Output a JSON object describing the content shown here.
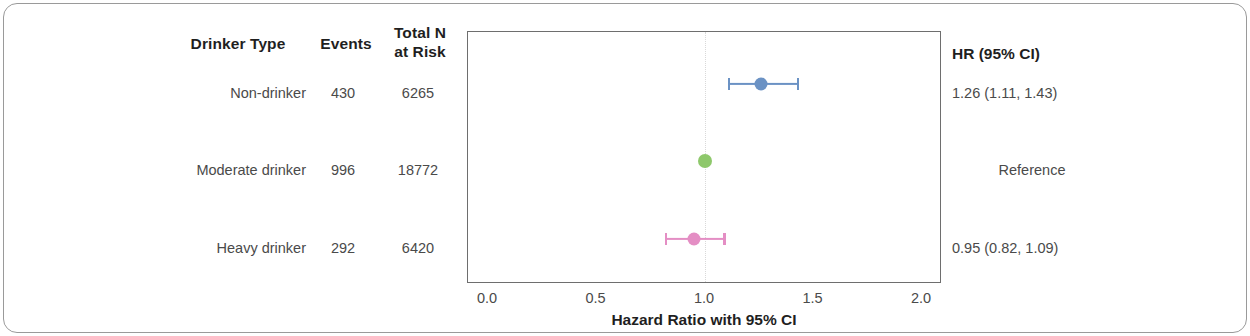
{
  "figure": {
    "width": 1250,
    "height": 336
  },
  "table": {
    "headers": {
      "drinker_type": "Drinker Type",
      "events": "Events",
      "total_n_line1": "Total N",
      "total_n_line2": "at Risk"
    },
    "rows": [
      {
        "label": "Non-drinker",
        "events": "430",
        "total_n": "6265"
      },
      {
        "label": "Moderate drinker",
        "events": "996",
        "total_n": "18772"
      },
      {
        "label": "Heavy drinker",
        "events": "292",
        "total_n": "6420"
      }
    ]
  },
  "hr_column": {
    "header": "HR (95% CI)",
    "values": [
      "1.26 (1.11, 1.43)",
      "Reference",
      "0.95 (0.82, 1.09)"
    ]
  },
  "axis": {
    "title": "Hazard Ratio with 95% CI",
    "ticks": [
      "0.0",
      "0.5",
      "1.0",
      "1.5",
      "2.0"
    ]
  },
  "colors": {
    "non_drinker": "#6b92c4",
    "moderate_drinker": "#8ec86b",
    "heavy_drinker": "#e48ec4",
    "reference_line": "#d9d9d9",
    "axis": "#6e6e6e",
    "frame": "#9a9a9a"
  },
  "chart_data": {
    "type": "scatter",
    "subtype": "forest-plot",
    "title": "",
    "xlabel": "Hazard Ratio with 95% CI",
    "ylabel": "",
    "xlim": [
      0.0,
      2.1
    ],
    "xticks": [
      0.0,
      0.5,
      1.0,
      1.5,
      2.0
    ],
    "grid": false,
    "legend": "none",
    "reference_line_x": 1.0,
    "categories": [
      "Non-drinker",
      "Moderate drinker",
      "Heavy drinker"
    ],
    "series": [
      {
        "name": "Hazard Ratio",
        "points": [
          {
            "category": "Non-drinker",
            "events": 430,
            "total_n_at_risk": 6265,
            "hr": 1.26,
            "ci_low": 1.11,
            "ci_high": 1.43,
            "label": "1.26 (1.11, 1.43)",
            "color": "#6b92c4",
            "is_reference": false
          },
          {
            "category": "Moderate drinker",
            "events": 996,
            "total_n_at_risk": 18772,
            "hr": 1.0,
            "ci_low": null,
            "ci_high": null,
            "label": "Reference",
            "color": "#8ec86b",
            "is_reference": true
          },
          {
            "category": "Heavy drinker",
            "events": 292,
            "total_n_at_risk": 6420,
            "hr": 0.95,
            "ci_low": 0.82,
            "ci_high": 1.09,
            "label": "0.95 (0.82, 1.09)",
            "color": "#e48ec4",
            "is_reference": false
          }
        ]
      }
    ]
  }
}
